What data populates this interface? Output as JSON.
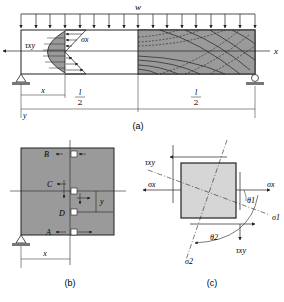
{
  "figure_a": {
    "load_label": "w",
    "tau_label": "τxy",
    "sigma_label": "σx",
    "x_axis_label": "x",
    "y_axis_label": "y",
    "dim_x": "x",
    "half_span_num": "l",
    "half_span_den": "2",
    "caption": "(a)"
  },
  "figure_b": {
    "points": [
      "B",
      "C",
      "D",
      "A"
    ],
    "dim_x": "x",
    "dim_y": "y",
    "caption": "(b)"
  },
  "figure_c": {
    "tau_top": "τxy",
    "tau_bottom": "τxy",
    "sigma_left": "σx",
    "sigma_right": "σx",
    "sigma1": "σ1",
    "sigma2": "σ2",
    "theta1": "θ1",
    "theta2": "θ2",
    "caption": "(c)"
  },
  "colors": {
    "shade": "#9a9a9a",
    "light_shade": "#d6d6d6",
    "line": "#222222"
  }
}
